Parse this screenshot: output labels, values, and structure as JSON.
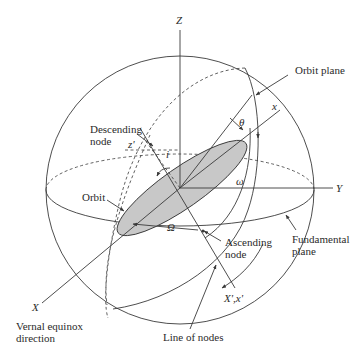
{
  "diagram": {
    "type": "orbital-elements",
    "axes": {
      "z_label": "Z",
      "y_label": "Y",
      "x_label": "X",
      "orbit_x_label": "x",
      "node_line_label": "X',x'"
    },
    "angles": {
      "theta": "θ",
      "omega_small": "ω",
      "omega_capital": "Ω",
      "inclination": "i",
      "z_prime": "z'"
    },
    "labels": {
      "orbit_plane": "Orbit plane",
      "descending_node_1": "Descending",
      "descending_node_2": "node",
      "orbit": "Orbit",
      "ascending_node_1": "Ascending",
      "ascending_node_2": "node",
      "fundamental_plane_1": "Fundamental",
      "fundamental_plane_2": "plane",
      "vernal_1": "Vernal equinox",
      "vernal_2": "direction",
      "line_of_nodes": "Line of nodes"
    },
    "colors": {
      "line": "#3a3a3a",
      "orbit_fill": "#c8c8c8",
      "background": "#ffffff"
    }
  }
}
